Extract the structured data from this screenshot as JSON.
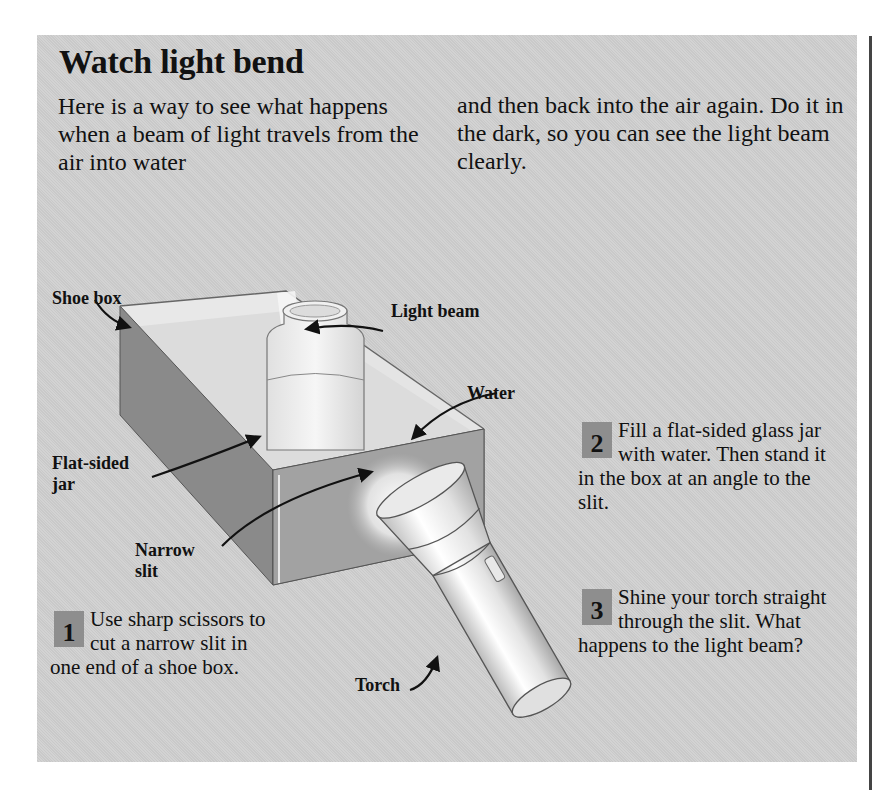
{
  "page": {
    "top_clipped_text": "p x y h p y g g g",
    "title": "Watch light bend",
    "intro": {
      "left": "Here is a way to see what happens when a beam of light travels from the air into water",
      "right": "and then back into the air again. Do it in the dark, so you can see the light beam clearly."
    }
  },
  "illustration": {
    "labels": {
      "shoe_box": "Shoe box",
      "light_beam": "Light beam",
      "water": "Water",
      "flat_sided_jar_1": "Flat-sided",
      "flat_sided_jar_2": "jar",
      "narrow_slit_1": "Narrow",
      "narrow_slit_2": "slit",
      "torch": "Torch"
    }
  },
  "steps": [
    {
      "number": "1",
      "text": "Use sharp scissors to cut a narrow slit in one end of a shoe box."
    },
    {
      "number": "2",
      "text": "Fill a flat-sided glass jar with water. Then stand it in the box at an angle to the slit."
    },
    {
      "number": "3",
      "text": "Shine your torch straight through the slit. What happens to the light beam?"
    }
  ],
  "colors": {
    "panel_bg": "#cfcfcf",
    "number_box": "#8e8e8e",
    "box_side_dark": "#8a8a8a",
    "box_front": "#a2a2a2"
  }
}
